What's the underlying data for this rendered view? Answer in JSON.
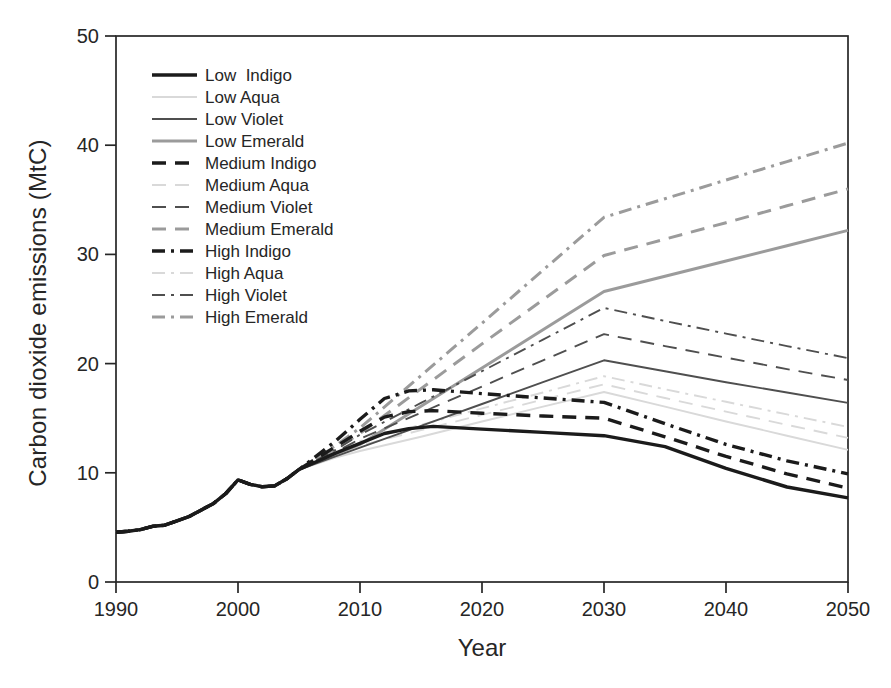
{
  "figure": {
    "background": "#ffffff"
  },
  "colors": {
    "ink": "#262626",
    "indigo": "#1b1b1b",
    "aqua": "#d9d9d9",
    "violet": "#4f4f4f",
    "emerald": "#9b9b9b"
  },
  "chart_data": {
    "type": "line",
    "title": "",
    "xlabel": "Year",
    "ylabel": "Carbon dioxide emissions (MtC)",
    "xlim": [
      1990,
      2050
    ],
    "ylim": [
      0,
      50
    ],
    "x_ticks": [
      1990,
      2000,
      2010,
      2020,
      2030,
      2040,
      2050
    ],
    "y_ticks": [
      0,
      10,
      20,
      30,
      40,
      50
    ],
    "grid": false,
    "frame": "box",
    "legend_position": "upper-left-inside",
    "common_history_points": [
      [
        1990,
        4.55
      ],
      [
        1991,
        4.65
      ],
      [
        1992,
        4.8
      ],
      [
        1993,
        5.1
      ],
      [
        1994,
        5.2
      ],
      [
        1995,
        5.6
      ],
      [
        1996,
        6.0
      ],
      [
        1997,
        6.6
      ],
      [
        1998,
        7.2
      ],
      [
        1999,
        8.1
      ],
      [
        2000,
        9.35
      ],
      [
        2001,
        8.95
      ],
      [
        2002,
        8.72
      ],
      [
        2003,
        8.8
      ],
      [
        2004,
        9.45
      ],
      [
        2005,
        10.3
      ]
    ],
    "series": [
      {
        "name": "Low  Indigo",
        "color_role": "indigo",
        "color": "#1b1b1b",
        "line_style": "solid",
        "weight": "thick",
        "points": [
          [
            2005,
            10.3
          ],
          [
            2008,
            11.8
          ],
          [
            2010,
            12.7
          ],
          [
            2012,
            13.6
          ],
          [
            2014,
            14.05
          ],
          [
            2016,
            14.25
          ],
          [
            2020,
            14.0
          ],
          [
            2025,
            13.7
          ],
          [
            2030,
            13.4
          ],
          [
            2035,
            12.4
          ],
          [
            2040,
            10.4
          ],
          [
            2045,
            8.7
          ],
          [
            2050,
            7.7
          ]
        ]
      },
      {
        "name": "Low Aqua",
        "color_role": "aqua",
        "color": "#d9d9d9",
        "line_style": "solid",
        "weight": "thin",
        "points": [
          [
            2005,
            10.3
          ],
          [
            2008,
            11.4
          ],
          [
            2010,
            12.0
          ],
          [
            2015,
            13.3
          ],
          [
            2020,
            14.7
          ],
          [
            2025,
            16.05
          ],
          [
            2030,
            17.4
          ],
          [
            2035,
            16.05
          ],
          [
            2040,
            14.7
          ],
          [
            2045,
            13.4
          ],
          [
            2050,
            12.1
          ]
        ]
      },
      {
        "name": "Low Violet",
        "color_role": "violet",
        "color": "#4f4f4f",
        "line_style": "solid",
        "weight": "thin",
        "points": [
          [
            2005,
            10.3
          ],
          [
            2008,
            11.5
          ],
          [
            2010,
            12.3
          ],
          [
            2015,
            14.3
          ],
          [
            2020,
            16.3
          ],
          [
            2025,
            18.3
          ],
          [
            2030,
            20.3
          ],
          [
            2035,
            19.3
          ],
          [
            2040,
            18.3
          ],
          [
            2045,
            17.35
          ],
          [
            2050,
            16.4
          ]
        ]
      },
      {
        "name": "Low Emerald",
        "color_role": "emerald",
        "color": "#9b9b9b",
        "line_style": "solid",
        "weight": "medium",
        "points": [
          [
            2005,
            10.3
          ],
          [
            2008,
            11.7
          ],
          [
            2010,
            12.6
          ],
          [
            2015,
            16.1
          ],
          [
            2020,
            19.6
          ],
          [
            2025,
            23.1
          ],
          [
            2030,
            26.6
          ],
          [
            2035,
            28.0
          ],
          [
            2040,
            29.4
          ],
          [
            2045,
            30.8
          ],
          [
            2050,
            32.2
          ]
        ]
      },
      {
        "name": "Medium Indigo",
        "color_role": "indigo",
        "color": "#1b1b1b",
        "line_style": "dashed",
        "weight": "thick",
        "points": [
          [
            2005,
            10.3
          ],
          [
            2008,
            12.4
          ],
          [
            2010,
            13.8
          ],
          [
            2012,
            15.1
          ],
          [
            2014,
            15.6
          ],
          [
            2016,
            15.7
          ],
          [
            2020,
            15.45
          ],
          [
            2025,
            15.2
          ],
          [
            2030,
            15.0
          ],
          [
            2035,
            13.3
          ],
          [
            2040,
            11.5
          ],
          [
            2045,
            9.9
          ],
          [
            2050,
            8.6
          ]
        ]
      },
      {
        "name": "Medium Aqua",
        "color_role": "aqua",
        "color": "#d9d9d9",
        "line_style": "dashed",
        "weight": "thin",
        "points": [
          [
            2005,
            10.3
          ],
          [
            2008,
            11.7
          ],
          [
            2010,
            12.5
          ],
          [
            2015,
            13.9
          ],
          [
            2020,
            15.3
          ],
          [
            2025,
            16.7
          ],
          [
            2030,
            18.1
          ],
          [
            2035,
            16.85
          ],
          [
            2040,
            15.6
          ],
          [
            2045,
            14.4
          ],
          [
            2050,
            13.2
          ]
        ]
      },
      {
        "name": "Medium Violet",
        "color_role": "violet",
        "color": "#4f4f4f",
        "line_style": "dashed",
        "weight": "thin",
        "points": [
          [
            2005,
            10.3
          ],
          [
            2008,
            11.9
          ],
          [
            2010,
            13.1
          ],
          [
            2015,
            15.5
          ],
          [
            2020,
            17.9
          ],
          [
            2025,
            20.3
          ],
          [
            2030,
            22.7
          ],
          [
            2035,
            21.6
          ],
          [
            2040,
            20.55
          ],
          [
            2045,
            19.5
          ],
          [
            2050,
            18.5
          ]
        ]
      },
      {
        "name": "Medium Emerald",
        "color_role": "emerald",
        "color": "#9b9b9b",
        "line_style": "dashed",
        "weight": "medium",
        "points": [
          [
            2005,
            10.3
          ],
          [
            2008,
            12.2
          ],
          [
            2010,
            13.6
          ],
          [
            2015,
            17.7
          ],
          [
            2020,
            21.8
          ],
          [
            2025,
            25.85
          ],
          [
            2030,
            29.9
          ],
          [
            2035,
            31.4
          ],
          [
            2040,
            32.9
          ],
          [
            2045,
            34.45
          ],
          [
            2050,
            36.0
          ]
        ]
      },
      {
        "name": "High Indigo",
        "color_role": "indigo",
        "color": "#1b1b1b",
        "line_style": "dashdot",
        "weight": "thick",
        "points": [
          [
            2005,
            10.3
          ],
          [
            2008,
            12.9
          ],
          [
            2010,
            14.9
          ],
          [
            2012,
            16.8
          ],
          [
            2014,
            17.5
          ],
          [
            2016,
            17.6
          ],
          [
            2020,
            17.25
          ],
          [
            2025,
            16.85
          ],
          [
            2030,
            16.45
          ],
          [
            2035,
            14.5
          ],
          [
            2040,
            12.6
          ],
          [
            2045,
            11.1
          ],
          [
            2050,
            9.9
          ]
        ]
      },
      {
        "name": "High Aqua",
        "color_role": "aqua",
        "color": "#d9d9d9",
        "line_style": "dashdot",
        "weight": "thin",
        "points": [
          [
            2005,
            10.3
          ],
          [
            2008,
            11.9
          ],
          [
            2010,
            12.9
          ],
          [
            2015,
            14.4
          ],
          [
            2020,
            15.9
          ],
          [
            2025,
            17.35
          ],
          [
            2030,
            18.85
          ],
          [
            2035,
            17.65
          ],
          [
            2040,
            16.5
          ],
          [
            2045,
            15.35
          ],
          [
            2050,
            14.2
          ]
        ]
      },
      {
        "name": "High Violet",
        "color_role": "violet",
        "color": "#4f4f4f",
        "line_style": "dashdot",
        "weight": "thin",
        "points": [
          [
            2005,
            10.3
          ],
          [
            2008,
            12.1
          ],
          [
            2010,
            13.5
          ],
          [
            2015,
            16.4
          ],
          [
            2020,
            19.3
          ],
          [
            2025,
            22.2
          ],
          [
            2030,
            25.1
          ],
          [
            2035,
            23.9
          ],
          [
            2040,
            22.75
          ],
          [
            2045,
            21.6
          ],
          [
            2050,
            20.5
          ]
        ]
      },
      {
        "name": "High Emerald",
        "color_role": "emerald",
        "color": "#9b9b9b",
        "line_style": "dashdot",
        "weight": "medium",
        "points": [
          [
            2005,
            10.3
          ],
          [
            2008,
            12.5
          ],
          [
            2010,
            14.1
          ],
          [
            2015,
            18.9
          ],
          [
            2020,
            23.7
          ],
          [
            2025,
            28.55
          ],
          [
            2030,
            33.4
          ],
          [
            2035,
            35.1
          ],
          [
            2040,
            36.8
          ],
          [
            2045,
            38.5
          ],
          [
            2050,
            40.2
          ]
        ]
      }
    ]
  }
}
